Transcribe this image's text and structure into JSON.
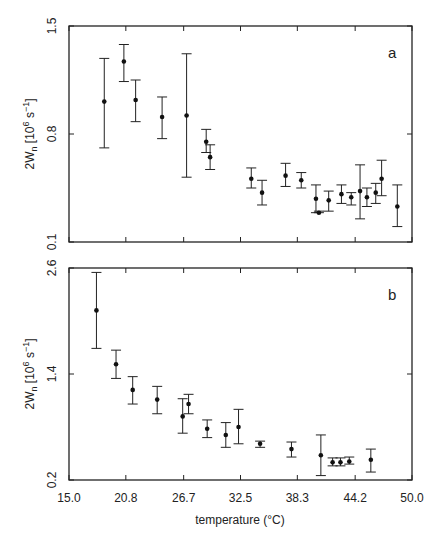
{
  "chart_data": [
    {
      "type": "scatter",
      "panel": "a",
      "title": "",
      "xlabel": "temperature (°C)",
      "ylabel": "2Wn [10^6 s^-1]",
      "ylabel_parts": {
        "main": "2W",
        "sub": "n",
        "bracket_open": "[10",
        "exp": "6",
        "unit": " s",
        "unit_exp": "−1",
        "bracket_close": "]"
      },
      "xlim": [
        15.0,
        50.0
      ],
      "ylim": [
        0.1,
        1.5
      ],
      "yticks": [
        0.1,
        0.8,
        1.5
      ],
      "ytick_labels": [
        "0.1",
        "0.8",
        "1.5"
      ],
      "xticks": [
        15.0,
        20.8,
        26.7,
        32.5,
        38.3,
        44.2,
        50.0
      ],
      "grid": false,
      "error_bars": true,
      "points": [
        {
          "x": 18.6,
          "y": 1.01,
          "lo": 0.71,
          "hi": 1.29
        },
        {
          "x": 20.6,
          "y": 1.27,
          "lo": 1.14,
          "hi": 1.38
        },
        {
          "x": 21.8,
          "y": 1.02,
          "lo": 0.88,
          "hi": 1.15
        },
        {
          "x": 24.5,
          "y": 0.91,
          "lo": 0.77,
          "hi": 1.04
        },
        {
          "x": 27.0,
          "y": 0.92,
          "lo": 0.52,
          "hi": 1.32
        },
        {
          "x": 29.0,
          "y": 0.75,
          "lo": 0.68,
          "hi": 0.83
        },
        {
          "x": 29.4,
          "y": 0.65,
          "lo": 0.57,
          "hi": 0.73
        },
        {
          "x": 33.6,
          "y": 0.51,
          "lo": 0.45,
          "hi": 0.58
        },
        {
          "x": 34.7,
          "y": 0.42,
          "lo": 0.34,
          "hi": 0.5
        },
        {
          "x": 37.1,
          "y": 0.53,
          "lo": 0.46,
          "hi": 0.61
        },
        {
          "x": 38.7,
          "y": 0.5,
          "lo": 0.45,
          "hi": 0.55
        },
        {
          "x": 40.2,
          "y": 0.38,
          "lo": 0.29,
          "hi": 0.47
        },
        {
          "x": 40.5,
          "y": 0.29,
          "lo": 0.29,
          "hi": 0.3
        },
        {
          "x": 41.5,
          "y": 0.37,
          "lo": 0.3,
          "hi": 0.43
        },
        {
          "x": 42.8,
          "y": 0.41,
          "lo": 0.35,
          "hi": 0.47
        },
        {
          "x": 43.8,
          "y": 0.39,
          "lo": 0.34,
          "hi": 0.42
        },
        {
          "x": 44.7,
          "y": 0.43,
          "lo": 0.25,
          "hi": 0.6
        },
        {
          "x": 45.4,
          "y": 0.39,
          "lo": 0.33,
          "hi": 0.45
        },
        {
          "x": 46.3,
          "y": 0.42,
          "lo": 0.35,
          "hi": 0.48
        },
        {
          "x": 46.9,
          "y": 0.51,
          "lo": 0.4,
          "hi": 0.63
        },
        {
          "x": 48.5,
          "y": 0.33,
          "lo": 0.2,
          "hi": 0.47
        }
      ]
    },
    {
      "type": "scatter",
      "panel": "b",
      "title": "",
      "xlabel": "temperature (°C)",
      "ylabel": "2Wn [10^6 s^-1]",
      "xlim": [
        15.0,
        50.0
      ],
      "ylim": [
        0.2,
        2.6
      ],
      "yticks": [
        0.2,
        1.4,
        2.6
      ],
      "ytick_labels": [
        "0.2",
        "1.4",
        "2.6"
      ],
      "xticks": [
        15.0,
        20.8,
        26.7,
        32.5,
        38.3,
        44.2,
        50.0
      ],
      "xtick_labels": [
        "15.0",
        "20.8",
        "26.7",
        "32.5",
        "38.3",
        "44.2",
        "50.0"
      ],
      "grid": false,
      "error_bars": true,
      "points": [
        {
          "x": 17.8,
          "y": 2.12,
          "lo": 1.69,
          "hi": 2.55
        },
        {
          "x": 19.8,
          "y": 1.51,
          "lo": 1.35,
          "hi": 1.67
        },
        {
          "x": 21.5,
          "y": 1.22,
          "lo": 1.06,
          "hi": 1.37
        },
        {
          "x": 24.0,
          "y": 1.11,
          "lo": 0.95,
          "hi": 1.26
        },
        {
          "x": 26.6,
          "y": 0.92,
          "lo": 0.73,
          "hi": 1.12
        },
        {
          "x": 27.2,
          "y": 1.06,
          "lo": 0.95,
          "hi": 1.17
        },
        {
          "x": 29.1,
          "y": 0.78,
          "lo": 0.68,
          "hi": 0.88
        },
        {
          "x": 31.0,
          "y": 0.71,
          "lo": 0.57,
          "hi": 0.85
        },
        {
          "x": 32.3,
          "y": 0.8,
          "lo": 0.61,
          "hi": 1.0
        },
        {
          "x": 34.5,
          "y": 0.61,
          "lo": 0.57,
          "hi": 0.64
        },
        {
          "x": 37.7,
          "y": 0.55,
          "lo": 0.46,
          "hi": 0.63
        },
        {
          "x": 40.7,
          "y": 0.48,
          "lo": 0.25,
          "hi": 0.71
        },
        {
          "x": 41.9,
          "y": 0.4,
          "lo": 0.36,
          "hi": 0.45
        },
        {
          "x": 42.7,
          "y": 0.4,
          "lo": 0.36,
          "hi": 0.45
        },
        {
          "x": 43.6,
          "y": 0.41,
          "lo": 0.38,
          "hi": 0.46
        },
        {
          "x": 45.8,
          "y": 0.43,
          "lo": 0.29,
          "hi": 0.55
        }
      ]
    }
  ],
  "labels": {
    "panel_a": "a",
    "panel_b": "b",
    "xlabel": "temperature (°C)",
    "ylabel_main": "2W",
    "ylabel_sub": "n",
    "ylabel_rest_1": "[10",
    "ylabel_exp": "6",
    "ylabel_rest_2": " s",
    "ylabel_exp2": "−1",
    "ylabel_rest_3": "]"
  }
}
